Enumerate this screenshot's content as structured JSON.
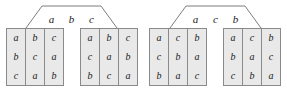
{
  "figure": {
    "background_color": "#ffffff",
    "cell_fill_color": "#e9e9e9",
    "border_color": "#8a8a8a",
    "text_color": "#1a1a1a"
  },
  "groups": [
    {
      "id": "left-group",
      "header": {
        "letters": [
          "a",
          "b",
          "c"
        ]
      },
      "bracket": {
        "shape": "trapezoid-connector"
      },
      "tables": [
        {
          "id": "left-group-table-1",
          "rows": [
            [
              "a",
              "b",
              "c"
            ],
            [
              "b",
              "c",
              "a"
            ],
            [
              "c",
              "a",
              "b"
            ]
          ]
        },
        {
          "id": "left-group-table-2",
          "rows": [
            [
              "a",
              "b",
              "c"
            ],
            [
              "c",
              "a",
              "b"
            ],
            [
              "b",
              "c",
              "a"
            ]
          ]
        }
      ]
    },
    {
      "id": "right-group",
      "header": {
        "letters": [
          "a",
          "c",
          "b"
        ]
      },
      "bracket": {
        "shape": "trapezoid-connector"
      },
      "tables": [
        {
          "id": "right-group-table-1",
          "rows": [
            [
              "a",
              "c",
              "b"
            ],
            [
              "c",
              "b",
              "a"
            ],
            [
              "b",
              "a",
              "c"
            ]
          ]
        },
        {
          "id": "right-group-table-2",
          "rows": [
            [
              "a",
              "c",
              "b"
            ],
            [
              "b",
              "a",
              "c"
            ],
            [
              "c",
              "b",
              "a"
            ]
          ]
        }
      ]
    }
  ]
}
